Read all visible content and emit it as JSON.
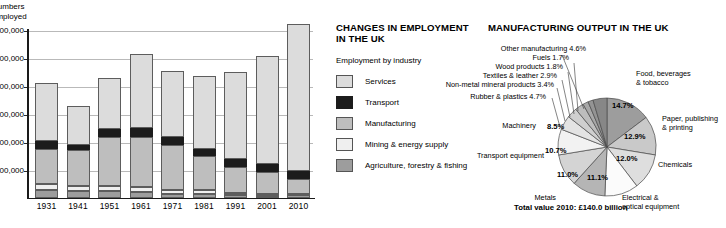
{
  "bar_panel": {
    "axis_title": "Numbers\nemployed",
    "y_ticks": [
      "30,000,000",
      "25,000,000",
      "20,000,000",
      "15,000,000",
      "10,000,000",
      "5,000,000"
    ],
    "x_ticks": [
      "1931",
      "1941",
      "1951",
      "1961",
      "1971",
      "1981",
      "1991",
      "2001",
      "2010"
    ]
  },
  "employment_panel": {
    "title": "CHANGES IN EMPLOYMENT\nIN THE UK",
    "legend_heading": "Employment by industry",
    "legend": [
      {
        "label": "Services",
        "color": "#dcdcdc",
        "key": "services"
      },
      {
        "label": "Transport",
        "color": "#1c1c1c",
        "key": "transport"
      },
      {
        "label": "Manufacturing",
        "color": "#bebebe",
        "key": "manufacturing"
      },
      {
        "label": "Mining & energy supply",
        "color": "#efefef",
        "key": "mining"
      },
      {
        "label": "Agriculture, forestry & fishing",
        "color": "#9d9d9d",
        "key": "agriculture"
      }
    ]
  },
  "pie_panel": {
    "title": "MANUFACTURING OUTPUT IN THE UK",
    "total_label": "Total value 2010: £140.0 billion",
    "callouts": {
      "food": "Food, beverages\n& tobacco",
      "paper": "Paper, publishing\n& printing",
      "chemicals": "Chemicals",
      "electrical": "Electrical &\noptical equipment",
      "metals": "Metals",
      "transport_equipment": "Transport\nequipment",
      "machinery": "Machinery",
      "rubber": "Rubber & plastics 4.7%",
      "nonmetal": "Non-metal mineral products 3.4%",
      "textiles": "Textiles & leather 2.9%",
      "wood": "Wood products 1.8%",
      "fuels": "Fuels 1.7%",
      "other": "Other manufacturing 4.6%"
    },
    "inner_pcts": {
      "food": "14.7%",
      "paper": "12.9%",
      "chemicals": "12.0%",
      "electrical": "11.1%",
      "metals": "11.0%",
      "transport_equipment": "10.7%",
      "machinery": "8.5%"
    }
  },
  "chart_data": [
    {
      "type": "bar",
      "subtype": "stacked-vertical",
      "title": "CHANGES IN EMPLOYMENT IN THE UK",
      "xlabel": "",
      "ylabel": "Numbers employed",
      "ylim": [
        0,
        32000000
      ],
      "grid": true,
      "y_tick_values": [
        30000000,
        25000000,
        20000000,
        15000000,
        10000000,
        5000000
      ],
      "y_tick_labels": [
        "30,000,000",
        "25,000,000",
        "20,000,000",
        "15,000,000",
        "10,000,000",
        "5,000,000"
      ],
      "categories": [
        "1931",
        "1941",
        "1951",
        "1961",
        "1971",
        "1981",
        "1991",
        "2001",
        "2010"
      ],
      "legend_position": "right",
      "series": [
        {
          "name": "Agriculture, forestry & fishing",
          "color": "#9d9d9d",
          "values": [
            1300000,
            1100000,
            1100000,
            950000,
            700000,
            600000,
            450000,
            350000,
            400000
          ]
        },
        {
          "name": "Mining & energy supply",
          "color": "#efefef",
          "values": [
            1200000,
            950000,
            900000,
            900000,
            600000,
            700000,
            350000,
            250000,
            300000
          ]
        },
        {
          "name": "Manufacturing",
          "color": "#bebebe",
          "values": [
            6300000,
            6500000,
            8900000,
            9100000,
            8200000,
            6200000,
            4700000,
            4000000,
            2700000
          ]
        },
        {
          "name": "Transport",
          "color": "#1c1c1c",
          "values": [
            1400000,
            900000,
            1400000,
            1500000,
            1400000,
            1300000,
            1400000,
            1400000,
            1400000
          ]
        },
        {
          "name": "Services",
          "color": "#dcdcdc",
          "values": [
            10300000,
            7050000,
            9200000,
            13250000,
            11900000,
            13000000,
            15600000,
            19500000,
            26300000
          ]
        }
      ]
    },
    {
      "type": "pie",
      "title": "MANUFACTURING OUTPUT IN THE UK",
      "total_label": "Total value 2010: £140.0 billion",
      "total_value": 140.0,
      "units": "£ billion",
      "labels": [
        "Food, beverages & tobacco",
        "Paper, publishing & printing",
        "Chemicals",
        "Electrical & optical equipment",
        "Metals",
        "Transport equipment",
        "Machinery",
        "Rubber & plastics",
        "Non-metal mineral products",
        "Textiles & leather",
        "Wood products",
        "Fuels",
        "Other manufacturing"
      ],
      "values": [
        14.7,
        12.9,
        12.0,
        11.1,
        11.0,
        10.7,
        8.5,
        4.7,
        3.4,
        2.9,
        1.8,
        1.7,
        4.6
      ],
      "colors": [
        "#9d9d9d",
        "#c9c9c9",
        "#dedede",
        "#fbfbfb",
        "#b5b5b5",
        "#d4d4d4",
        "#f2f2f2",
        "#e3e3e3",
        "#cfcfcf",
        "#bdbdbd",
        "#a8a8a8",
        "#949494",
        "#878787"
      ],
      "start_angle_deg": 0,
      "direction": "clockwise"
    }
  ]
}
